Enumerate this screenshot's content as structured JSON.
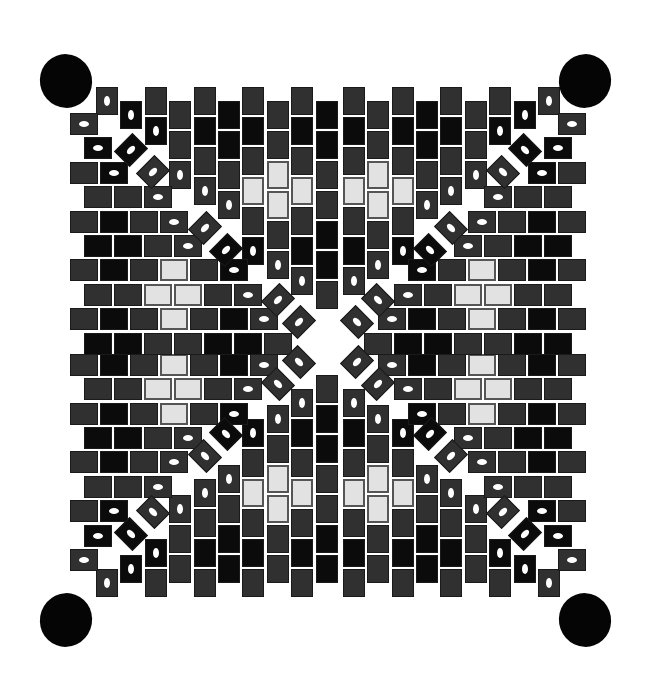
{
  "figure": {
    "title": "Square beadwork pattern with four corner ovals"
  },
  "colors": {
    "d": "#303030",
    "k": "#0b0b0b",
    "l": "#e2e2e2",
    "background": "#ffffff",
    "hole": "#ffffff"
  },
  "legend": {
    "d": "dark grey bead",
    "k": "black bead",
    "l": "light grey bead",
    "h": "bead with visible hole"
  },
  "geometry": {
    "center_x": 328,
    "center_y": 342,
    "col_pitch": 24.4,
    "bead_pitch": 30,
    "bead_long": 28,
    "bead_short": 22,
    "first_col_x": 96,
    "even_col_top": 87,
    "odd_col_top": 101
  },
  "top_columns": [
    [
      "dh"
    ],
    [
      "kh"
    ],
    [
      "d",
      "kh"
    ],
    [
      "d",
      "d",
      "dh"
    ],
    [
      "d",
      "k",
      "d",
      "dh"
    ],
    [
      "k",
      "k",
      "d",
      "dh"
    ],
    [
      "d",
      "k",
      "d",
      "l",
      "d",
      "kh"
    ],
    [
      "d",
      "d",
      "l",
      "l",
      "d",
      "dh"
    ],
    [
      "d",
      "k",
      "d",
      "l",
      "d",
      "k",
      "dh"
    ],
    [
      "k",
      "k",
      "d",
      "d",
      "k",
      "k",
      "d"
    ]
  ],
  "diagonal_beads": [
    {
      "cx": 131,
      "cy": 150,
      "c": "kh"
    },
    {
      "cx": 153,
      "cy": 172,
      "c": "dh"
    },
    {
      "cx": 205,
      "cy": 228,
      "c": "dh"
    },
    {
      "cx": 226,
      "cy": 250,
      "c": "kh"
    },
    {
      "cx": 278,
      "cy": 300,
      "c": "dh"
    },
    {
      "cx": 299,
      "cy": 322,
      "c": "dh"
    }
  ],
  "corner_ovals": [
    {
      "name": "top-left",
      "cx": 66,
      "cy": 81,
      "rx": 26,
      "ry": 27,
      "rot": -20
    },
    {
      "name": "top-right",
      "cx": 585,
      "cy": 81,
      "rx": 26,
      "ry": 27,
      "rot": 20
    },
    {
      "name": "bottom-left",
      "cx": 66,
      "cy": 620,
      "rx": 26,
      "ry": 27,
      "rot": 20
    },
    {
      "name": "bottom-right",
      "cx": 585,
      "cy": 620,
      "rx": 26,
      "ry": 27,
      "rot": -20
    }
  ]
}
